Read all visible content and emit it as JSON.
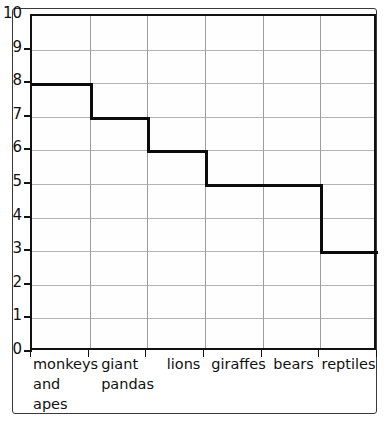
{
  "chart_data": {
    "type": "bar",
    "title": "",
    "subtitle": "",
    "xlabel": "",
    "ylabel": "",
    "categories": [
      "monkeys and apes",
      "giant pandas",
      "lions",
      "giraffes",
      "bears",
      "reptiles"
    ],
    "category_lines": [
      [
        "monkeys",
        "and",
        "apes"
      ],
      [
        "giant",
        "pandas"
      ],
      [
        "lions"
      ],
      [
        "giraffes"
      ],
      [
        "bears"
      ],
      [
        "reptiles"
      ]
    ],
    "values": [
      8,
      7,
      6,
      5,
      5,
      3
    ],
    "ylim": [
      0,
      10
    ],
    "ytick_step": 1,
    "ytick_labels": [
      "0",
      "1",
      "2",
      "3",
      "4",
      "5",
      "6",
      "7",
      "8",
      "9",
      "10"
    ],
    "grid": true,
    "legend": "none",
    "style": "step-bar-outline",
    "colors": {
      "bar_line": "#0b0b0b",
      "axis": "#111111",
      "grid": "#b4b4b4",
      "background": "#ffffff",
      "frame": "#3a3a3a"
    }
  }
}
